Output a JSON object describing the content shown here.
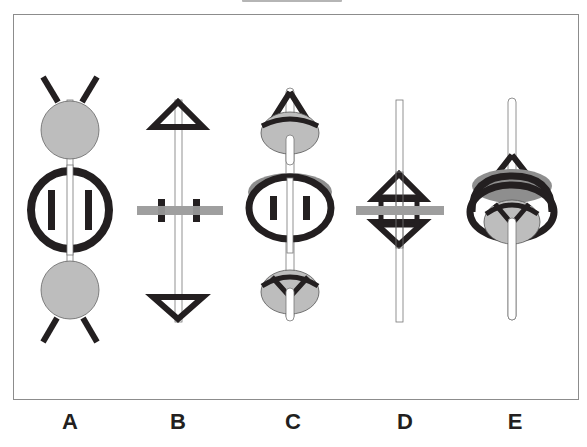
{
  "figure": {
    "title_visible": false,
    "options": [
      {
        "label": "A",
        "x": 70,
        "description": "two gray spheres with X-shaped diagonal bars, central bold ring with two vertical bars, thin rod"
      },
      {
        "label": "B",
        "x": 178,
        "description": "thin rod with top and bottom triangles, central gray horizontal bar with two black blocks"
      },
      {
        "label": "C",
        "x": 290,
        "description": "rod with top cone-disk, central elliptical ring with bars, bottom disk with Y bracket"
      },
      {
        "label": "D",
        "x": 400,
        "description": "thin rod with central diamond bracket and gray horizontal bar"
      },
      {
        "label": "E",
        "x": 512,
        "description": "rod with cone top, elliptical ring around disk with Y bracket"
      }
    ]
  },
  "colors": {
    "ink": "#231f20",
    "gray_fill": "#bdbdbd",
    "dark_gray": "#8e8e8e",
    "rod_fill": "#ffffff",
    "frame": "#8c8c8c"
  }
}
